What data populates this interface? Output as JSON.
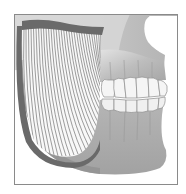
{
  "illustration": {
    "subject": "masseter muscle on lateral view of jaw and skull",
    "style": "grayscale anatomical illustration",
    "alt": "Lateral view of the lower face showing the masseter muscle fibers over the mandible with upper and lower teeth in occlusion"
  },
  "frame": {
    "x": 14,
    "y": 14,
    "width": 164,
    "height": 171,
    "border_color": "#8a8a8a"
  },
  "colors": {
    "background": "#ffffff",
    "bone_light": "#d4d4d4",
    "bone_mid": "#b4b4b4",
    "bone_dark": "#9a9a9a",
    "muscle_fill": "#f6f6f6",
    "muscle_fibers": "#5a5a5a",
    "muscle_band": "#6e6e6e",
    "teeth": "#f4f4f4",
    "teeth_outline": "#8c8c8c"
  },
  "teeth": {
    "upper_count": 6,
    "lower_count": 6
  },
  "muscle": {
    "fiber_count": 34
  }
}
